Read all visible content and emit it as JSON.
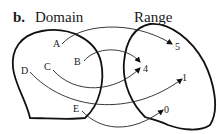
{
  "figure": {
    "panel_label": "b.",
    "domain_title": "Domain",
    "range_title": "Range"
  },
  "domain": {
    "elements": [
      {
        "label": "A",
        "maps_to": "5"
      },
      {
        "label": "B",
        "maps_to": "4"
      },
      {
        "label": "C",
        "maps_to": "4"
      },
      {
        "label": "D",
        "maps_to": "1"
      },
      {
        "label": "E",
        "maps_to": "0"
      }
    ]
  },
  "range": {
    "elements": [
      {
        "label": "5"
      },
      {
        "label": "4"
      },
      {
        "label": "1"
      },
      {
        "label": "0"
      }
    ]
  },
  "colors": {
    "stroke": "#111111",
    "background": "#ffffff"
  }
}
